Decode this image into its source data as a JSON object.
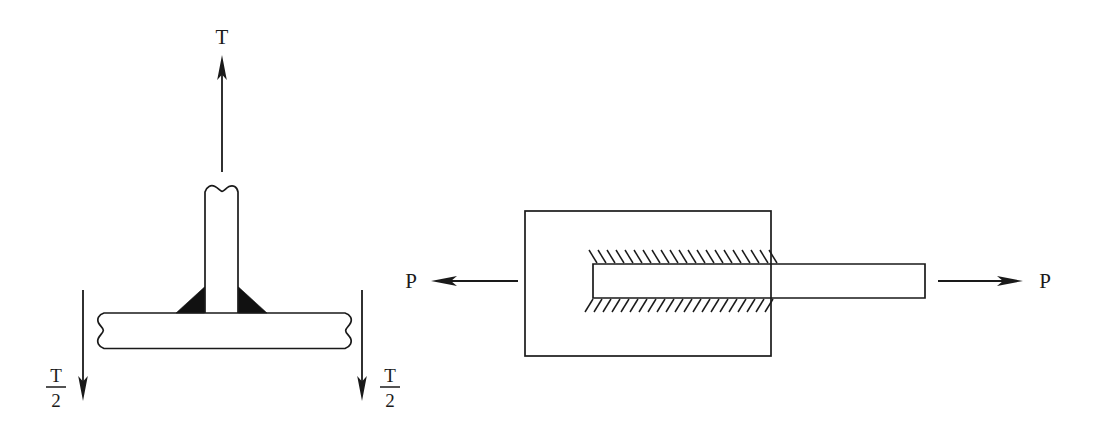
{
  "figure": {
    "background_color": "#ffffff",
    "line_color": "#1a1a1a",
    "weld_fill_color": "#111111",
    "width": 1096,
    "height": 445
  },
  "left_diagram": {
    "name": "tee-joint-fillet-weld",
    "description": "Tee joint with double fillet weld loaded by tensile force T, reacted by two T/2 forces",
    "labels": {
      "load": "T",
      "reaction_left_numerator": "T",
      "reaction_left_denominator": "2",
      "reaction_right_numerator": "T",
      "reaction_right_denominator": "2"
    },
    "arrows": [
      {
        "name": "load-arrow-up",
        "label": "T",
        "direction": "up",
        "x": 222,
        "tail_y": 172,
        "tip_y": 57
      },
      {
        "name": "reaction-arrow-left-down",
        "label": "T/2",
        "direction": "down",
        "x": 83,
        "tail_y": 290,
        "tip_y": 400
      },
      {
        "name": "reaction-arrow-right-down",
        "label": "T/2",
        "direction": "down",
        "x": 362,
        "tail_y": 290,
        "tip_y": 400
      }
    ],
    "members": {
      "vertical_plate": {
        "name": "vertical-plate",
        "left": 205,
        "right": 238,
        "top": 188,
        "bottom": 312,
        "break": "wavy-top"
      },
      "horizontal_plate": {
        "name": "horizontal-plate",
        "left": 97,
        "right": 351,
        "top": 313,
        "bottom": 349,
        "break": "s-curve-both-ends"
      }
    },
    "welds": [
      {
        "name": "fillet-weld-left",
        "shape": "triangle"
      },
      {
        "name": "fillet-weld-right",
        "shape": "triangle"
      }
    ]
  },
  "right_diagram": {
    "name": "lap-joint-shear",
    "description": "Lap joint: inner bar embedded in outer block with hatched weld interfaces, loaded in tension by forces P",
    "labels": {
      "load_left": "P",
      "load_right": "P"
    },
    "arrows": [
      {
        "name": "load-arrow-left",
        "label": "P",
        "direction": "left",
        "y": 281,
        "tail_x": 518,
        "tip_x": 432
      },
      {
        "name": "load-arrow-right",
        "label": "P",
        "direction": "right",
        "y": 281,
        "tail_x": 938,
        "tip_x": 1022
      }
    ],
    "members": {
      "outer_block": {
        "name": "outer-block",
        "left": 525,
        "right": 771,
        "top": 211,
        "bottom": 356
      },
      "inner_bar": {
        "name": "inner-bar",
        "left": 593,
        "right": 925,
        "top": 264,
        "bottom": 298
      }
    },
    "hatching": {
      "top_band": {
        "name": "weld-hatch-top",
        "from_x": 597,
        "to_x": 776,
        "y": 263,
        "length": 13,
        "spacing": 9,
        "lean": "up-left"
      },
      "bottom_band": {
        "name": "weld-hatch-bottom",
        "from_x": 593,
        "to_x": 776,
        "y": 299,
        "length": 13,
        "spacing": 9,
        "lean": "down-left"
      }
    }
  }
}
